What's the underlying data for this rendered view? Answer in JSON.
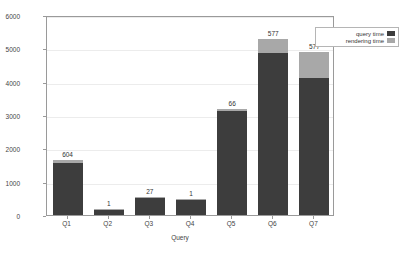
{
  "chart_data": {
    "type": "bar",
    "stacked": true,
    "title": "",
    "xlabel": "Query",
    "ylabel": "Time in ms",
    "categories": [
      "Q1",
      "Q2",
      "Q3",
      "Q4",
      "Q5",
      "Q6",
      "Q7"
    ],
    "ylim": [
      0,
      6000
    ],
    "yticks": [
      0,
      1000,
      2000,
      3000,
      4000,
      5000,
      6000
    ],
    "ytick_labels": [
      "0",
      "1000",
      "2000",
      "3000",
      "4000",
      "5000",
      "6000"
    ],
    "grid": true,
    "legend_position": "top-right",
    "series": [
      {
        "name": "query time",
        "color": "#3d3d3d",
        "values": [
          1560,
          170,
          500,
          440,
          3110,
          4870,
          4120
        ]
      },
      {
        "name": "rendering time",
        "color": "#a8a8a8",
        "values": [
          90,
          20,
          40,
          40,
          70,
          410,
          760
        ]
      }
    ],
    "bar_labels": [
      "604",
      "1",
      "27",
      "1",
      "66",
      "577",
      "577"
    ],
    "bar_totals": [
      1650,
      190,
      540,
      480,
      3180,
      5280,
      4880
    ]
  },
  "legend": {
    "items": [
      {
        "label": "query time",
        "swatch": "query-swatch"
      },
      {
        "label": "rendering time",
        "swatch": "rendering-swatch"
      }
    ]
  }
}
